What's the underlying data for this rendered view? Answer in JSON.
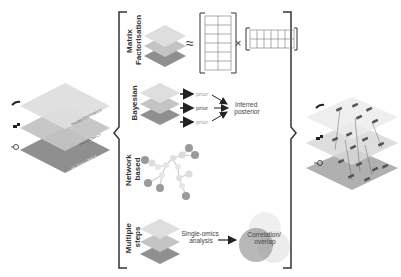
{
  "colors": {
    "layer_top": "#d6d6d6",
    "layer_mid": "#bcbcbc",
    "layer_bottom": "#8f8f8f",
    "bracket": "#333333",
    "text": "#333333",
    "muted_text": "#888888"
  },
  "input_stack": {
    "layers": [
      {
        "label": "TRANSCRIPTOMICS",
        "icon": "dna-icon"
      },
      {
        "label": "PROTEOMICS",
        "icon": "protein-icon"
      },
      {
        "label": "METABOLOMICS",
        "icon": "molecule-icon"
      }
    ]
  },
  "methods": [
    {
      "title_line1": "Matrix",
      "title_line2": "Factorisation",
      "approx_symbol": "≈",
      "times_symbol": "×"
    },
    {
      "title_line1": "Bayesian",
      "title_line2": "",
      "priors": [
        "prior",
        "prior",
        "prior"
      ],
      "result_line1": "Inferred",
      "result_line2": "posterior"
    },
    {
      "title_line1": "Network",
      "title_line2": "based"
    },
    {
      "title_line1": "Multiple",
      "title_line2": "steps",
      "step_line1": "Single-omics",
      "step_line2": "analysis",
      "result_line1": "Correlation/",
      "result_line2": "overlap"
    }
  ],
  "output_stack": {
    "description": "integrated multi-omics network across layers"
  }
}
